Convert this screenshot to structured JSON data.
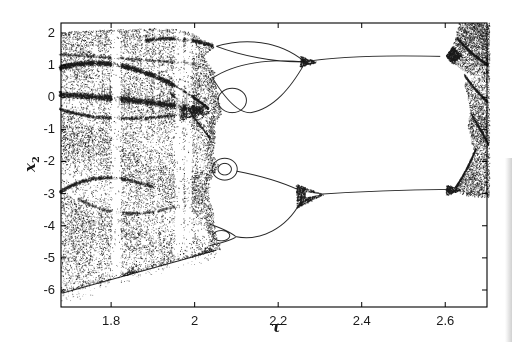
{
  "figure": {
    "width": 512,
    "height": 342,
    "background": "#ffffff",
    "ink_color": "#1a1a1a"
  },
  "chart_data": {
    "type": "scatter",
    "variant": "bifurcation-diagram",
    "title": "",
    "xlabel": "τ",
    "ylabel_base": "x",
    "ylabel_sub": "2",
    "xlim": [
      1.68,
      2.7
    ],
    "ylim": [
      -6.53,
      2.31
    ],
    "grid": false,
    "legend": null,
    "xticks": [
      {
        "v": 1.8,
        "label": "1.8"
      },
      {
        "v": 2.0,
        "label": "2"
      },
      {
        "v": 2.2,
        "label": "2.2"
      },
      {
        "v": 2.4,
        "label": "2.4"
      },
      {
        "v": 2.6,
        "label": "2.6"
      }
    ],
    "yticks": [
      {
        "v": 2,
        "label": "2"
      },
      {
        "v": 1,
        "label": "1"
      },
      {
        "v": 0,
        "label": "0"
      },
      {
        "v": -1,
        "label": "-1"
      },
      {
        "v": -2,
        "label": "-2"
      },
      {
        "v": -3,
        "label": "-3"
      },
      {
        "v": -4,
        "label": "-4"
      },
      {
        "v": -5,
        "label": "-5"
      },
      {
        "v": -6,
        "label": "-6"
      }
    ],
    "plot_box_px": {
      "left": 61,
      "top": 23,
      "right": 487,
      "bottom": 307
    },
    "seed": 1337,
    "features": {
      "chaotic_band_tau": [
        1.68,
        2.06
      ],
      "chaotic_band_x2_top_env": [
        1.9,
        2.2
      ],
      "chaotic_band_x2_bottom_env": [
        -6.1,
        -4.7
      ],
      "periodic_window_tau": [
        1.81,
        1.96,
        1.985
      ],
      "inverse_period_doubling_merge_tau": [
        2.26,
        2.3
      ],
      "period1_branches_x2": [
        1.25,
        -2.9
      ],
      "branch_end_tau": 2.61,
      "chaos_reentry_tau": 2.62
    },
    "chaos_left": {
      "n": 52000,
      "base": 0.55,
      "top_env": [
        [
          1.68,
          2.04
        ],
        [
          1.8,
          2.11
        ],
        [
          1.9,
          2.15
        ],
        [
          1.955,
          2.12
        ],
        [
          2.005,
          1.97
        ],
        [
          2.046,
          1.6
        ]
      ],
      "bot_env": {
        "v0": -6.1,
        "t0": 1.68,
        "slope": 3.6,
        "sparse_depth": 0.35,
        "sparse_p": 0.16,
        "sparse_n": 1800
      },
      "right_edge": [
        [
          -6.6,
          2.06
        ],
        [
          -4.6,
          2.06
        ],
        [
          -4.3,
          2.052
        ],
        [
          -3.95,
          2.046
        ],
        [
          -3.55,
          2.044
        ],
        [
          -3.05,
          2.032
        ],
        [
          -2.6,
          2.038
        ],
        [
          -2.12,
          2.056
        ],
        [
          -1.75,
          2.044
        ],
        [
          -1.3,
          2.048
        ],
        [
          -0.8,
          2.05
        ],
        [
          -0.48,
          2.064
        ],
        [
          -0.15,
          2.058
        ],
        [
          0.2,
          2.054
        ],
        [
          0.5,
          2.046
        ],
        [
          0.78,
          2.048
        ],
        [
          1.06,
          2.03
        ],
        [
          1.3,
          2.022
        ],
        [
          1.58,
          2.048
        ],
        [
          1.9,
          2.005
        ],
        [
          2.31,
          1.96
        ]
      ]
    },
    "windows": [
      [
        1.758,
        1.768,
        0.5
      ],
      [
        1.8,
        1.822,
        0.1
      ],
      [
        1.872,
        1.881,
        0.45
      ],
      [
        1.903,
        1.911,
        0.4
      ],
      [
        1.952,
        1.972,
        0.12
      ],
      [
        1.977,
        1.992,
        0.15
      ]
    ],
    "dense_strips": [
      [
        1.993,
        2.012,
        1.35
      ]
    ],
    "dark_arcs": [
      {
        "m": [
          1.675,
          0.92
        ],
        "c": [
          1.795,
          1.4
        ],
        "e": [
          1.945,
          0.42
        ],
        "th": 0.09,
        "n": 2400,
        "a": 0.85
      },
      {
        "m": [
          1.945,
          0.42
        ],
        "c": [
          1.99,
          0.1
        ],
        "e": [
          2.032,
          -0.34
        ],
        "th": 0.05,
        "n": 700,
        "a": 0.85
      },
      {
        "m": [
          1.675,
          0.1
        ],
        "c": [
          1.85,
          -0.03
        ],
        "e": [
          2.02,
          -0.38
        ],
        "th": 0.11,
        "n": 3200,
        "a": 0.8
      },
      {
        "m": [
          1.675,
          -0.36
        ],
        "c": [
          1.8,
          -0.88
        ],
        "e": [
          2.005,
          -0.45
        ],
        "th": 0.06,
        "n": 1300,
        "a": 0.7
      },
      {
        "m": [
          1.675,
          1.35
        ],
        "c": [
          1.83,
          1.22
        ],
        "e": [
          2.0,
          1.06
        ],
        "th": 0.05,
        "n": 900,
        "a": 0.55
      },
      {
        "m": [
          1.88,
          1.78
        ],
        "c": [
          1.97,
          1.95
        ],
        "e": [
          2.044,
          1.6
        ],
        "th": 0.07,
        "n": 1000,
        "a": 0.7
      },
      {
        "m": [
          1.675,
          -2.95
        ],
        "c": [
          1.77,
          -2.12
        ],
        "e": [
          1.9,
          -2.8
        ],
        "th": 0.07,
        "n": 1300,
        "a": 0.65
      },
      {
        "m": [
          1.72,
          -3.15
        ],
        "c": [
          1.83,
          -3.95
        ],
        "e": [
          1.96,
          -3.35
        ],
        "th": 0.06,
        "n": 800,
        "a": 0.5
      },
      {
        "m": [
          1.94,
          0.15
        ],
        "c": [
          1.99,
          -0.45
        ],
        "e": [
          2.035,
          -1.25
        ],
        "th": 0.05,
        "n": 600,
        "a": 0.6
      },
      {
        "m": [
          2.628,
          1.85
        ],
        "c": [
          2.668,
          1.25
        ],
        "e": [
          2.702,
          1.02
        ],
        "th": 0.05,
        "n": 700,
        "a": 0.8
      },
      {
        "m": [
          2.645,
          0.7
        ],
        "c": [
          2.675,
          0.15
        ],
        "e": [
          2.7,
          -0.12
        ],
        "th": 0.05,
        "n": 600,
        "a": 0.7
      },
      {
        "m": [
          2.663,
          -0.55
        ],
        "c": [
          2.69,
          -1.15
        ],
        "e": [
          2.702,
          -1.45
        ],
        "th": 0.05,
        "n": 500,
        "a": 0.7
      },
      {
        "m": [
          2.624,
          -2.8
        ],
        "c": [
          2.652,
          -2.25
        ],
        "e": [
          2.672,
          -1.6
        ],
        "th": 0.04,
        "n": 600,
        "a": 0.8
      }
    ],
    "hairs": {
      "n": 72,
      "t_range": [
        1.69,
        2.01
      ],
      "v0": 0.13,
      "slope": -1.05,
      "jitter": 0.2,
      "len": [
        0.12,
        0.45
      ]
    },
    "branch_curves": [
      {
        "b": [
          [
            2.052,
            1.585
          ],
          [
            2.12,
            1.84
          ],
          [
            2.2,
            1.78
          ],
          [
            2.262,
            1.12
          ]
        ]
      },
      {
        "b": [
          [
            2.052,
            1.585
          ],
          [
            2.11,
            1.3
          ],
          [
            2.19,
            1.08
          ],
          [
            2.262,
            1.1
          ]
        ]
      },
      {
        "b": [
          [
            2.043,
            0.6
          ],
          [
            2.1,
            1.08
          ],
          [
            2.18,
            1.2
          ],
          [
            2.262,
            1.1
          ]
        ]
      },
      {
        "b": [
          [
            2.043,
            0.6
          ],
          [
            2.08,
            -0.2
          ],
          [
            2.11,
            -0.5
          ],
          [
            2.135,
            -0.48
          ]
        ]
      },
      {
        "b": [
          [
            2.135,
            -0.48
          ],
          [
            2.19,
            -0.35
          ],
          [
            2.23,
            0.3
          ],
          [
            2.262,
            1.02
          ]
        ]
      },
      {
        "e": [
          2.09,
          -0.1,
          0.034,
          0.38
        ]
      },
      {
        "e": [
          2.072,
          -2.24,
          0.03,
          0.34
        ]
      },
      {
        "e": [
          2.072,
          -2.24,
          0.016,
          0.18
        ]
      },
      {
        "b": [
          [
            2.1,
            -2.3
          ],
          [
            2.16,
            -2.45
          ],
          [
            2.21,
            -2.65
          ],
          [
            2.248,
            -2.88
          ]
        ]
      },
      {
        "b": [
          [
            2.036,
            -3.95
          ],
          [
            2.07,
            -4.1
          ],
          [
            2.09,
            -4.25
          ],
          [
            2.098,
            -4.33
          ]
        ]
      },
      {
        "b": [
          [
            2.036,
            -4.62
          ],
          [
            2.07,
            -4.52
          ],
          [
            2.09,
            -4.42
          ],
          [
            2.098,
            -4.36
          ]
        ]
      },
      {
        "e": [
          2.064,
          -4.31,
          0.02,
          0.16
        ]
      },
      {
        "b": [
          [
            2.098,
            -4.34
          ],
          [
            2.16,
            -4.5
          ],
          [
            2.22,
            -4.05
          ],
          [
            2.252,
            -3.3
          ]
        ]
      },
      {
        "b": [
          [
            2.262,
            1.1
          ],
          [
            2.34,
            1.27
          ],
          [
            2.46,
            1.31
          ],
          [
            2.588,
            1.27
          ]
        ]
      },
      {
        "b": [
          [
            2.298,
            -3.02
          ],
          [
            2.4,
            -2.93
          ],
          [
            2.5,
            -2.88
          ],
          [
            2.604,
            -2.87
          ]
        ]
      },
      {
        "b": [
          [
            1.683,
            -6.1
          ],
          [
            1.8,
            -5.67
          ],
          [
            1.93,
            -5.22
          ],
          [
            2.052,
            -4.76
          ]
        ]
      }
    ],
    "knots": [
      {
        "pts": [
          [
            2.252,
            1.3
          ],
          [
            2.252,
            0.94
          ],
          [
            2.292,
            1.1
          ]
        ],
        "n": 500
      },
      {
        "pts": [
          [
            2.243,
            -2.7
          ],
          [
            2.243,
            -3.44
          ],
          [
            2.308,
            -3.02
          ]
        ],
        "n": 1500
      },
      {
        "pts": [
          [
            2.6,
            1.28
          ],
          [
            2.617,
            1.58
          ],
          [
            2.638,
            1.3
          ],
          [
            2.617,
            1.05
          ]
        ],
        "n": 1200
      },
      {
        "pts": [
          [
            2.602,
            -2.72
          ],
          [
            2.602,
            -3.05
          ],
          [
            2.638,
            -2.88
          ]
        ],
        "n": 500
      },
      {
        "pts": [
          [
            1.963,
            -0.25
          ],
          [
            1.963,
            -0.7
          ],
          [
            2.042,
            -0.47
          ]
        ],
        "n": 700
      },
      {
        "pts": [
          [
            1.825,
            -5.58
          ],
          [
            1.862,
            -5.44
          ],
          [
            1.85,
            -5.26
          ]
        ],
        "n": 160
      },
      {
        "pts": [
          [
            2.005,
            -4.93
          ],
          [
            2.045,
            -4.78
          ],
          [
            2.03,
            -4.6
          ]
        ],
        "n": 160
      }
    ],
    "white_notches": [
      [
        [
          2.266,
          -2.96
        ],
        [
          2.306,
          -3.02
        ],
        [
          2.266,
          -3.12
        ]
      ]
    ],
    "chaos_right": {
      "n": 18000,
      "base": 0.6,
      "poly": [
        [
          2.633,
          2.31
        ],
        [
          2.705,
          2.31
        ],
        [
          2.705,
          -3.12
        ],
        [
          2.648,
          -3.05
        ],
        [
          2.63,
          -2.94
        ],
        [
          2.62,
          -2.84
        ],
        [
          2.632,
          -2.6
        ],
        [
          2.652,
          -2.22
        ],
        [
          2.668,
          -1.75
        ],
        [
          2.662,
          -1.3
        ],
        [
          2.653,
          -0.9
        ],
        [
          2.66,
          -0.42
        ],
        [
          2.652,
          0.1
        ],
        [
          2.642,
          0.45
        ],
        [
          2.658,
          0.72
        ],
        [
          2.632,
          0.92
        ],
        [
          2.617,
          1.1
        ],
        [
          2.607,
          1.3
        ],
        [
          2.618,
          1.62
        ],
        [
          2.626,
          2.0
        ]
      ],
      "notch": [
        [
          2.622,
          0.98
        ],
        [
          2.67,
          0.62
        ],
        [
          2.636,
          0.38
        ]
      ]
    }
  }
}
